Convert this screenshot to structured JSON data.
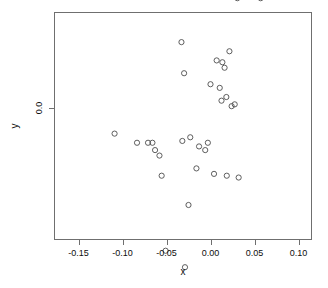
{
  "chart_data": {
    "type": "scatter",
    "title": "",
    "xlabel": "x",
    "ylabel": "y",
    "grid": false,
    "legend": null,
    "marker": "open-circle",
    "marker_color": "#4d4d4d",
    "frame_color": "#6f6f6f",
    "background": "#ffffff",
    "xlim": [
      -0.178,
      0.118
    ],
    "ylim": [
      -0.345,
      0.252
    ],
    "xticks": [
      -0.15,
      -0.1,
      -0.05,
      0.0,
      0.05,
      0.1
    ],
    "xticklabels": [
      "-0.15",
      "-0.10",
      "-0.05",
      "0.00",
      "0.05",
      "0.10"
    ],
    "yticks": [
      0.2,
      0.1,
      0.0,
      -0.1,
      -0.2,
      -0.3
    ],
    "yticklabels": [
      "0.2",
      "0.1",
      "0.0",
      "-0.1",
      "-0.2",
      "-0.3"
    ],
    "n_points": 120,
    "points": [
      [
        -0.1655,
        -0.0525
      ],
      [
        -0.109,
        -0.007
      ],
      [
        -0.096,
        -0.329
      ],
      [
        -0.0845,
        0.0575
      ],
      [
        -0.084,
        -0.1125
      ],
      [
        -0.0835,
        -0.0095
      ],
      [
        -0.071,
        -0.0095
      ],
      [
        -0.07,
        -0.1375
      ],
      [
        -0.066,
        -0.0095
      ],
      [
        -0.063,
        -0.0115
      ],
      [
        -0.06,
        -0.3155
      ],
      [
        -0.058,
        -0.013
      ],
      [
        -0.0555,
        -0.0185
      ],
      [
        -0.0525,
        -0.052
      ],
      [
        -0.051,
        -0.039
      ],
      [
        -0.0425,
        -0.088
      ],
      [
        -0.037,
        0.08
      ],
      [
        -0.0355,
        0.077
      ],
      [
        -0.0345,
        -0.0645
      ],
      [
        -0.0335,
        -0.108
      ],
      [
        -0.033,
        0.018
      ],
      [
        -0.032,
        -0.009
      ],
      [
        -0.031,
        -0.15
      ],
      [
        -0.03,
        0.0095
      ],
      [
        -0.029,
        -0.0435
      ],
      [
        -0.028,
        -0.072
      ],
      [
        -0.0265,
        0.096
      ],
      [
        -0.025,
        -0.0265
      ],
      [
        -0.024,
        -0.102
      ],
      [
        -0.0235,
        0.1
      ],
      [
        -0.023,
        -0.008
      ],
      [
        -0.021,
        -0.135
      ],
      [
        -0.02,
        -0.071
      ],
      [
        -0.0195,
        0.0895
      ],
      [
        -0.0185,
        -0.1175
      ],
      [
        -0.0175,
        0.166
      ],
      [
        -0.017,
        0.195
      ],
      [
        -0.0165,
        0.067
      ],
      [
        -0.016,
        -0.0165
      ],
      [
        -0.0145,
        0.054
      ],
      [
        -0.013,
        -0.0105
      ],
      [
        -0.011,
        0.0605
      ],
      [
        -0.01,
        0.149
      ],
      [
        -0.009,
        -0.087
      ],
      [
        -0.008,
        0.0355
      ],
      [
        -0.006,
        -0.0115
      ],
      [
        -0.005,
        0.051
      ],
      [
        -0.0045,
        0.063
      ],
      [
        -0.0035,
        0.142
      ],
      [
        -0.003,
        -0.0095
      ],
      [
        -0.001,
        0.114
      ],
      [
        0.0,
        0.0065
      ],
      [
        0.0005,
        0.189
      ],
      [
        0.001,
        0.0675
      ],
      [
        0.0015,
        0.059
      ],
      [
        0.002,
        -0.087
      ],
      [
        0.0025,
        0.1275
      ],
      [
        0.003,
        0.1535
      ],
      [
        0.0035,
        0.053
      ],
      [
        0.004,
        -0.018
      ],
      [
        0.0045,
        0.0705
      ],
      [
        0.005,
        -0.085
      ],
      [
        0.0055,
        0.169
      ],
      [
        0.006,
        0.045
      ],
      [
        0.0065,
        -0.0915
      ],
      [
        0.007,
        0.013
      ],
      [
        0.0075,
        -0.094
      ],
      [
        0.008,
        0.1075
      ],
      [
        0.0085,
        0.0605
      ],
      [
        0.009,
        -0.089
      ],
      [
        0.0095,
        0.133
      ],
      [
        0.01,
        0.0565
      ],
      [
        0.0105,
        0.0055
      ],
      [
        0.011,
        0.147
      ],
      [
        0.0115,
        0.049
      ],
      [
        0.012,
        0.2375
      ],
      [
        0.0125,
        0.002
      ],
      [
        0.013,
        0.175
      ],
      [
        0.0135,
        0.0125
      ],
      [
        0.014,
        -0.084
      ],
      [
        0.0145,
        0.118
      ],
      [
        0.015,
        0.0545
      ],
      [
        0.0155,
        0.064
      ],
      [
        0.016,
        0.011
      ],
      [
        0.0165,
        0.1575
      ],
      [
        0.017,
        0.048
      ],
      [
        0.018,
        0.003
      ],
      [
        0.0185,
        -0.0185
      ],
      [
        0.019,
        0.1065
      ],
      [
        0.0195,
        0.2125
      ],
      [
        0.02,
        0.0585
      ],
      [
        0.021,
        0.0375
      ],
      [
        0.0215,
        0.0155
      ],
      [
        0.0225,
        0.105
      ],
      [
        0.0235,
        0.109
      ],
      [
        0.024,
        0.0005
      ],
      [
        0.025,
        0.1
      ],
      [
        0.0255,
        0.043
      ],
      [
        0.026,
        0.182
      ],
      [
        0.027,
        0.144
      ],
      [
        0.0275,
        0.001
      ],
      [
        0.0285,
        0.1065
      ],
      [
        0.029,
        0.1595
      ],
      [
        0.03,
        0.109
      ],
      [
        0.0305,
        0.03
      ],
      [
        0.0315,
        0.1055
      ],
      [
        0.032,
        -0.019
      ],
      [
        0.033,
        0.099
      ],
      [
        0.034,
        0.2135
      ],
      [
        0.035,
        0.136
      ],
      [
        0.0365,
        0.068
      ],
      [
        0.038,
        0.151
      ],
      [
        0.042,
        0.15
      ],
      [
        0.044,
        0.212
      ],
      [
        0.046,
        0.08
      ],
      [
        0.049,
        0.065
      ],
      [
        0.05,
        -0.143
      ],
      [
        0.0545,
        0.1505
      ],
      [
        0.057,
        0.03
      ],
      [
        0.061,
        0.1485
      ],
      [
        0.083,
        0.178
      ],
      [
        0.089,
        0.1695
      ],
      [
        0.0995,
        0.198
      ],
      [
        0.1085,
        0.0625
      ]
    ]
  },
  "layout": {
    "frame": {
      "left": 54,
      "top": 12,
      "right": 312,
      "bottom": 240
    },
    "x_pixel_at_zero": 210.5,
    "x_pixels_per_unit": 880,
    "y_pixel_at_zero": 108,
    "y_pixels_per_unit": 3660,
    "marker_radius": 2.6
  }
}
